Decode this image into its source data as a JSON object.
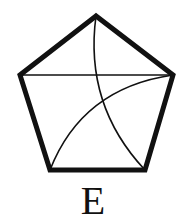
{
  "figure": {
    "label": "E",
    "colors": {
      "stroke": "#111111",
      "background": "#ffffff"
    }
  }
}
